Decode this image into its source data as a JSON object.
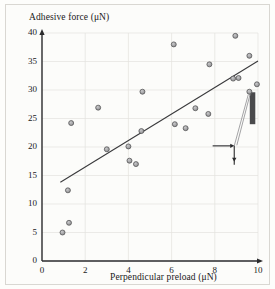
{
  "figure": {
    "background_color": "#fcfcfa",
    "frame_color": "#d9d7d2"
  },
  "chart_data": {
    "type": "scatter",
    "title": "",
    "xlabel": "Perpendicular preload (μN)",
    "ylabel": "Adhesive force (μN)",
    "xlim": [
      0,
      10
    ],
    "ylim": [
      0,
      40
    ],
    "xticks": [
      0,
      2,
      4,
      6,
      8,
      10
    ],
    "yticks": [
      0,
      5,
      10,
      15,
      20,
      25,
      30,
      35,
      40
    ],
    "xtick_labels": [
      "0",
      "2",
      "4",
      "6",
      "8",
      "10"
    ],
    "ytick_labels": [
      "0",
      "5",
      "10",
      "15",
      "20",
      "25",
      "30",
      "35",
      "40"
    ],
    "grid": true,
    "grid_color": "#e4e2de",
    "legend": null,
    "marker": {
      "shape": "circle",
      "fill_color": "#8e8e90",
      "edge_color": "#4a4a4c",
      "size_px": 5
    },
    "points": [
      {
        "x": 0.95,
        "y": 5.0
      },
      {
        "x": 1.25,
        "y": 6.7
      },
      {
        "x": 1.2,
        "y": 12.4
      },
      {
        "x": 1.35,
        "y": 24.2
      },
      {
        "x": 2.6,
        "y": 26.9
      },
      {
        "x": 3.0,
        "y": 19.6
      },
      {
        "x": 4.0,
        "y": 20.1
      },
      {
        "x": 4.05,
        "y": 17.6
      },
      {
        "x": 4.35,
        "y": 17.0
      },
      {
        "x": 4.6,
        "y": 22.8
      },
      {
        "x": 4.65,
        "y": 29.7
      },
      {
        "x": 6.1,
        "y": 38.0
      },
      {
        "x": 6.15,
        "y": 24.0
      },
      {
        "x": 6.65,
        "y": 23.3
      },
      {
        "x": 7.1,
        "y": 26.8
      },
      {
        "x": 7.7,
        "y": 25.8
      },
      {
        "x": 7.75,
        "y": 34.5
      },
      {
        "x": 8.85,
        "y": 32.0
      },
      {
        "x": 8.95,
        "y": 39.5
      },
      {
        "x": 9.1,
        "y": 32.1
      },
      {
        "x": 9.6,
        "y": 29.7
      },
      {
        "x": 9.6,
        "y": 36.0
      },
      {
        "x": 9.95,
        "y": 31.0
      }
    ],
    "trendline": {
      "type": "linear-fit",
      "x_start": 0.85,
      "y_start": 13.8,
      "x_end": 10.0,
      "y_end": 35.1,
      "color": "#3a3a3c"
    },
    "annotation": {
      "name": "seta-surface-schematic",
      "description": "Schematic of a seta contacting a vertical surface with preload and adhesive force arrows",
      "surface_color": "#4a4a4c",
      "arrow_color": "#2a2a2c",
      "horizontal_arrow": {
        "x_start": 7.9,
        "y": 20.2,
        "x_end": 8.9
      },
      "vertical_arrow": {
        "x": 8.9,
        "y_start": 20.2,
        "y_end": 17.4
      },
      "seta_line": {
        "x_start": 8.9,
        "y_start": 20.2,
        "x_end": 9.55,
        "y_end": 29.2
      }
    }
  },
  "axis_titles": {
    "y": "Adhesive force (μN)",
    "x": "Perpendicular preload (μN)"
  }
}
